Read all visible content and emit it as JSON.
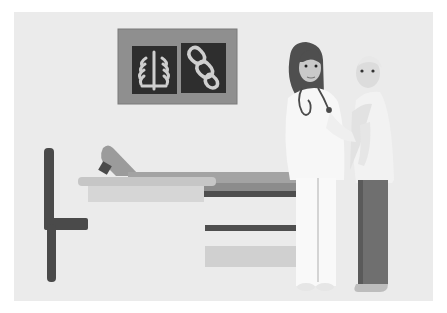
{
  "scene": {
    "description": "Grayscale flat illustration of a doctor consulting a patient in an examination room",
    "colors": {
      "page_bg": "#ffffff",
      "panel_bg": "#ebebeb",
      "xray_frame": "#8f8f8f",
      "xray_film": "#2e2e2e",
      "bone": "#cfcfcf",
      "dark": "#4a4a4a",
      "coat": "#f7f7f7",
      "bed_top": "#a9a9a9",
      "bed_light": "#d0d0d0",
      "pants": "#6f6f6f"
    },
    "elements": {
      "xray_board": "x-ray light box showing ribcage and spine scans",
      "exam_bed": "examination bed with raised backrest",
      "chair": "chair silhouette on left",
      "doctor": "female doctor with stethoscope in white coat",
      "patient": "elderly patient standing beside doctor"
    }
  }
}
